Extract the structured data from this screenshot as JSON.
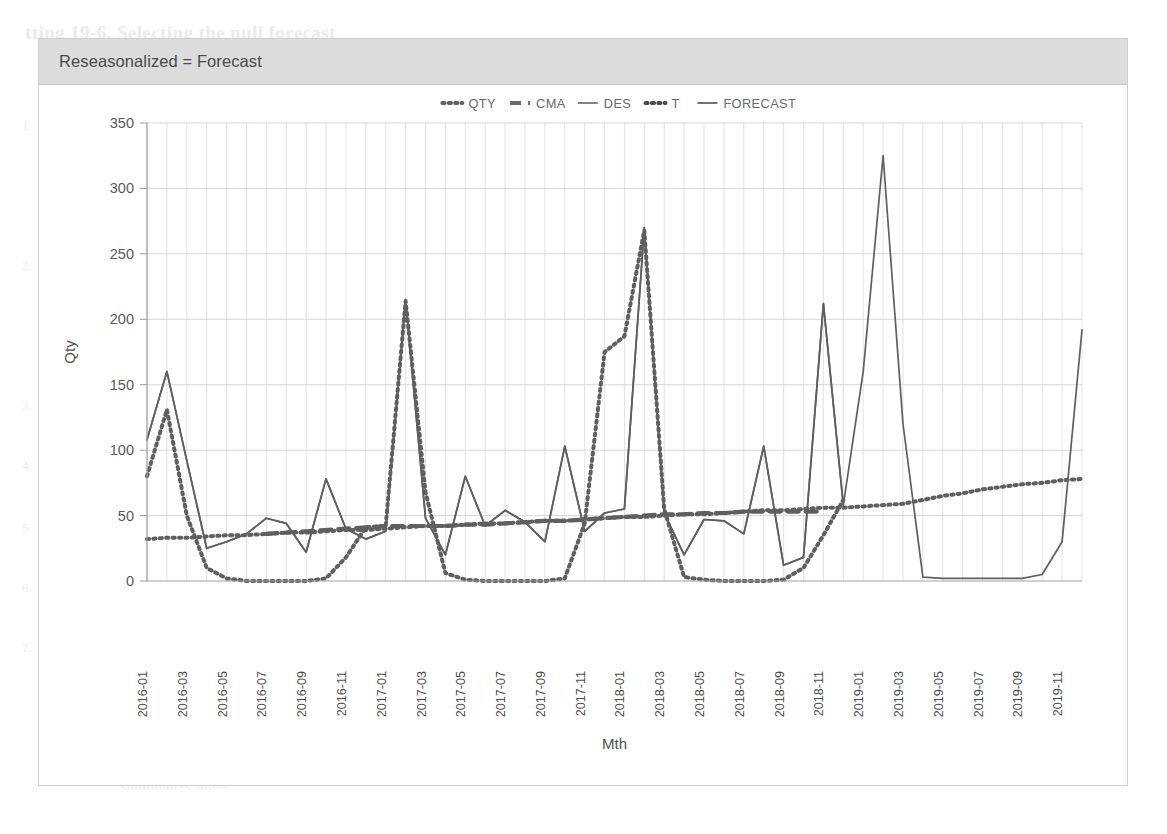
{
  "card": {
    "title": "Reseasonalized = Forecast"
  },
  "chart_data": {
    "type": "line",
    "title": "Reseasonalized = Forecast",
    "xlabel": "Mth",
    "ylabel": "Qty",
    "ylim": [
      0,
      350
    ],
    "ytick_step": 50,
    "yticks": [
      0,
      50,
      100,
      150,
      200,
      250,
      300,
      350
    ],
    "grid": true,
    "legend_position": "top-center",
    "legend": [
      {
        "name": "QTY",
        "style": "dotted",
        "color": "#5f5f5f"
      },
      {
        "name": "CMA",
        "style": "dashed",
        "color": "#6b6b6b"
      },
      {
        "name": "DES",
        "style": "solid",
        "color": "#6e6e6e"
      },
      {
        "name": "T",
        "style": "dotted",
        "color": "#4a4a4a"
      },
      {
        "name": "FORECAST",
        "style": "solid",
        "color": "#5a5a5a"
      }
    ],
    "x": [
      "2016-01",
      "2016-02",
      "2016-03",
      "2016-04",
      "2016-05",
      "2016-06",
      "2016-07",
      "2016-08",
      "2016-09",
      "2016-10",
      "2016-11",
      "2016-12",
      "2017-01",
      "2017-02",
      "2017-03",
      "2017-04",
      "2017-05",
      "2017-06",
      "2017-07",
      "2017-08",
      "2017-09",
      "2017-10",
      "2017-11",
      "2017-12",
      "2018-01",
      "2018-02",
      "2018-03",
      "2018-04",
      "2018-05",
      "2018-06",
      "2018-07",
      "2018-08",
      "2018-09",
      "2018-10",
      "2018-11",
      "2018-12",
      "2019-01",
      "2019-02",
      "2019-03",
      "2019-04",
      "2019-05",
      "2019-06",
      "2019-07",
      "2019-08",
      "2019-09",
      "2019-10",
      "2019-11",
      "2019-12"
    ],
    "xticks": [
      "2016-01",
      "2016-03",
      "2016-05",
      "2016-07",
      "2016-09",
      "2016-11",
      "2017-01",
      "2017-03",
      "2017-05",
      "2017-07",
      "2017-09",
      "2017-11",
      "2018-01",
      "2018-03",
      "2018-05",
      "2018-07",
      "2018-09",
      "2018-11",
      "2019-01",
      "2019-03",
      "2019-05",
      "2019-07",
      "2019-09",
      "2019-11"
    ],
    "series": [
      {
        "name": "QTY",
        "style": "dotted",
        "values": [
          80,
          131,
          50,
          10,
          2,
          0,
          0,
          0,
          0,
          2,
          18,
          41,
          42,
          214,
          68,
          6,
          1,
          0,
          0,
          0,
          0,
          2,
          44,
          175,
          187,
          268,
          55,
          3,
          1,
          0,
          0,
          0,
          1,
          10,
          35,
          62,
          null,
          null,
          null,
          null,
          null,
          null,
          null,
          null,
          null,
          null,
          null,
          null
        ]
      },
      {
        "name": "CMA",
        "style": "dashed",
        "values": [
          null,
          null,
          null,
          null,
          null,
          null,
          36,
          37,
          38,
          39,
          40,
          41,
          42,
          42,
          42,
          42,
          43,
          43,
          44,
          45,
          46,
          46,
          47,
          48,
          49,
          50,
          51,
          51,
          52,
          52,
          53,
          53,
          53,
          53,
          53,
          null,
          null,
          null,
          null,
          null,
          null,
          null,
          null,
          null,
          null,
          null,
          null,
          null
        ]
      },
      {
        "name": "DES",
        "style": "solid",
        "values": [
          108,
          160,
          92,
          25,
          30,
          36,
          48,
          44,
          22,
          78,
          40,
          32,
          38,
          215,
          48,
          20,
          80,
          42,
          54,
          45,
          30,
          103,
          38,
          52,
          55,
          270,
          52,
          20,
          47,
          46,
          36,
          103,
          12,
          18,
          212,
          58,
          null,
          null,
          null,
          null,
          null,
          null,
          null,
          null,
          null,
          null,
          null,
          null
        ]
      },
      {
        "name": "T",
        "style": "dotted",
        "values": [
          32,
          33,
          33,
          34,
          35,
          35,
          36,
          37,
          37,
          38,
          39,
          39,
          40,
          41,
          42,
          42,
          43,
          44,
          44,
          45,
          46,
          46,
          47,
          48,
          49,
          49,
          50,
          51,
          51,
          52,
          53,
          54,
          54,
          55,
          56,
          56,
          57,
          58,
          59,
          62,
          65,
          67,
          70,
          72,
          74,
          75,
          77,
          78
        ]
      },
      {
        "name": "FORECAST",
        "style": "solid",
        "values": [
          108,
          160,
          92,
          25,
          30,
          36,
          48,
          44,
          22,
          78,
          40,
          32,
          38,
          215,
          48,
          20,
          80,
          42,
          54,
          45,
          30,
          103,
          38,
          52,
          55,
          270,
          52,
          20,
          47,
          46,
          36,
          103,
          12,
          18,
          212,
          58,
          160,
          325,
          120,
          3,
          2,
          2,
          2,
          2,
          2,
          5,
          30,
          192
        ]
      }
    ]
  },
  "bleed_text": {
    "heading": "tting 19-6. Selecting the null forecast",
    "lines": [
      "Wh  cuuld",
      "AE Listing 15-",
      "Variable : Final, to view sales forecast W",
      "Sheet  any sales  to date",
      "Variable   Final  Cumulative  record   Wh",
      "Mth 15  Shipped  any",
      "Cumulative  $.5.3"
    ],
    "numbers": [
      "1.",
      "2.",
      "3.",
      "4.",
      "5.",
      "6.",
      "7."
    ]
  }
}
